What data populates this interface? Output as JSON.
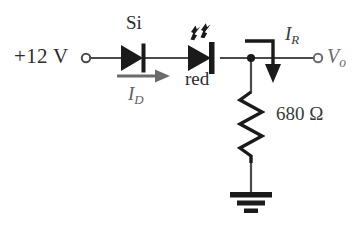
{
  "figure": {
    "type": "circuit-schematic",
    "background_color": "#ffffff",
    "wire_color": "#3a3a3a",
    "symbol_color": "#1a1a1a"
  },
  "labels": {
    "supply": "+12 V",
    "diode_si": "Si",
    "led": "red",
    "resistor": "680 Ω",
    "current_diode": "I",
    "current_diode_sub": "D",
    "current_resistor": "I",
    "current_resistor_sub": "R",
    "output": "V",
    "output_sub": "o"
  },
  "components": [
    {
      "name": "voltage-source-terminal",
      "type": "terminal",
      "label": "+12 V"
    },
    {
      "name": "silicon-diode",
      "type": "diode",
      "label": "Si",
      "orientation": "anode-left"
    },
    {
      "name": "red-led",
      "type": "led",
      "label": "red",
      "orientation": "anode-left",
      "emits_light": true
    },
    {
      "name": "output-terminal",
      "type": "terminal",
      "label": "Vo"
    },
    {
      "name": "resistor-680",
      "type": "resistor",
      "value": "680 Ω",
      "orientation": "vertical"
    },
    {
      "name": "ground",
      "type": "ground"
    }
  ],
  "currents": [
    {
      "name": "diode-current",
      "symbol": "ID",
      "direction": "right"
    },
    {
      "name": "resistor-current",
      "symbol": "IR",
      "direction": "down"
    }
  ]
}
